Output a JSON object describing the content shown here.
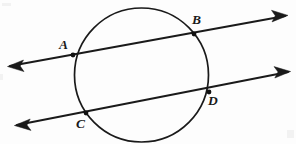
{
  "figure": {
    "background_color": "#fdfdfd",
    "stroke_color": "#1a1a1a",
    "width": 296,
    "height": 144,
    "circle": {
      "name": "circle",
      "cx": 141.5,
      "cy": 75,
      "r": 67
    },
    "lines": [
      {
        "name": "secant-line-ab",
        "through_points": [
          "A",
          "B"
        ],
        "x1": 10,
        "y1": 66,
        "x2": 285,
        "y2": 16,
        "arrow_start": true,
        "arrow_end": true
      },
      {
        "name": "secant-line-cd",
        "through_points": [
          "C",
          "D"
        ],
        "x1": 17,
        "y1": 125,
        "x2": 288,
        "y2": 72,
        "arrow_start": true,
        "arrow_end": true
      }
    ],
    "points": [
      {
        "id": "A",
        "label": "A",
        "x": 73,
        "y": 55,
        "label_x": 59,
        "label_y": 38
      },
      {
        "id": "B",
        "label": "B",
        "x": 194,
        "y": 34,
        "label_x": 192,
        "label_y": 13
      },
      {
        "id": "C",
        "label": "C",
        "x": 86,
        "y": 113,
        "label_x": 76,
        "label_y": 117
      },
      {
        "id": "D",
        "label": "D",
        "x": 209,
        "y": 92,
        "label_x": 208,
        "label_y": 94
      }
    ]
  }
}
